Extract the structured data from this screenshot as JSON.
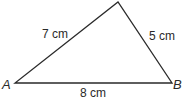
{
  "diagram": {
    "type": "triangle",
    "vertices": {
      "A": {
        "label": "A"
      },
      "B": {
        "label": "B"
      }
    },
    "sides": {
      "AC": {
        "label": "7 cm"
      },
      "BC": {
        "label": "5 cm"
      },
      "AB": {
        "label": "8 cm"
      }
    },
    "line_color": "#2a2a2a"
  }
}
